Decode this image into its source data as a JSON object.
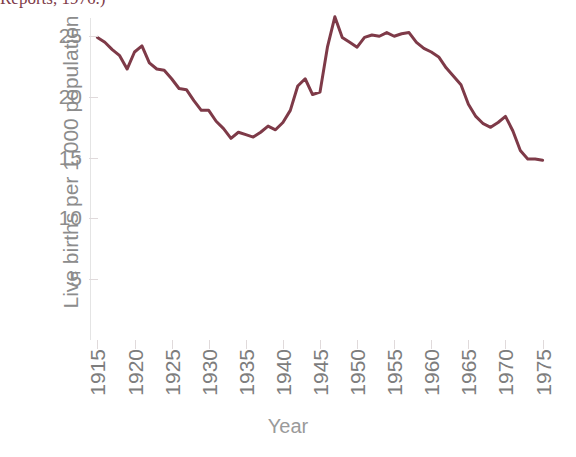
{
  "caption": {
    "text": "Reports, 1976.)"
  },
  "chart_data": {
    "type": "line",
    "title": "",
    "xlabel": "Year",
    "ylabel": "Live births per 1,000 population",
    "xlim": [
      1914,
      1976
    ],
    "ylim": [
      0,
      26.5
    ],
    "grid": false,
    "legend": "none",
    "line_color": "#7e3a48",
    "xticks": [
      1915,
      1920,
      1925,
      1930,
      1935,
      1940,
      1945,
      1950,
      1955,
      1960,
      1965,
      1970,
      1975
    ],
    "xtick_labels": [
      "1915",
      "1920",
      "1925",
      "1930",
      "1935",
      "1940",
      "1945",
      "1950",
      "1955",
      "1960",
      "1965",
      "1970",
      "1975"
    ],
    "yticks": [
      5,
      10,
      15,
      20,
      25
    ],
    "ytick_labels": [
      "5",
      "10",
      "15",
      "20",
      "25"
    ],
    "series": [
      {
        "name": "Live birth rate",
        "x": [
          1915,
          1916,
          1917,
          1918,
          1919,
          1920,
          1921,
          1922,
          1923,
          1924,
          1925,
          1926,
          1927,
          1928,
          1929,
          1930,
          1931,
          1932,
          1933,
          1934,
          1935,
          1936,
          1937,
          1938,
          1939,
          1940,
          1941,
          1942,
          1943,
          1944,
          1945,
          1946,
          1947,
          1948,
          1949,
          1950,
          1951,
          1952,
          1953,
          1954,
          1955,
          1956,
          1957,
          1958,
          1959,
          1960,
          1961,
          1962,
          1963,
          1964,
          1965,
          1966,
          1967,
          1968,
          1969,
          1970,
          1971,
          1972,
          1973,
          1974,
          1975
        ],
        "y": [
          24.9,
          24.5,
          23.9,
          23.4,
          22.3,
          23.7,
          24.2,
          22.8,
          22.3,
          22.2,
          21.5,
          20.7,
          20.6,
          19.7,
          18.9,
          18.9,
          18.0,
          17.4,
          16.6,
          17.1,
          16.9,
          16.7,
          17.1,
          17.6,
          17.3,
          17.9,
          18.9,
          20.9,
          21.5,
          20.2,
          20.4,
          24.1,
          26.6,
          24.9,
          24.5,
          24.1,
          24.9,
          25.1,
          25.0,
          25.3,
          25.0,
          25.2,
          25.3,
          24.5,
          24.0,
          23.7,
          23.3,
          22.4,
          21.7,
          21.0,
          19.4,
          18.4,
          17.8,
          17.5,
          17.9,
          18.4,
          17.2,
          15.6,
          14.9,
          14.9,
          14.8
        ]
      }
    ]
  }
}
